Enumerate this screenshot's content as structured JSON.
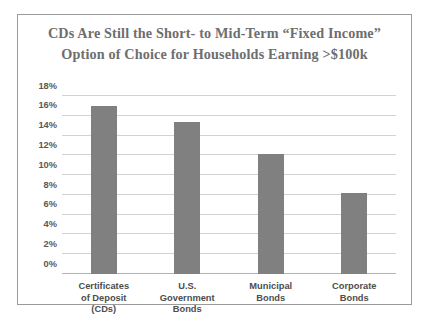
{
  "chart_data": {
    "type": "bar",
    "title": "CDs Are Still the Short- to Mid-Term “Fixed Income” Option of Choice for Households Earning >$100k",
    "title_lines": [
      "CDs Are Still the Short- to Mid-Term “Fixed Income”",
      "Option of Choice for Households Earning >$100k"
    ],
    "categories": [
      "Certificates of Deposit (CDs)",
      "U.S. Government Bonds",
      "Municipal Bonds",
      "Corporate Bonds"
    ],
    "category_lines": [
      [
        "Certificates",
        "of Deposit",
        "(CDs)"
      ],
      [
        "U.S.",
        "Government",
        "Bonds"
      ],
      [
        "Municipal",
        "Bonds"
      ],
      [
        "Corporate",
        "Bonds"
      ]
    ],
    "values": [
      17.0,
      15.4,
      12.1,
      8.2
    ],
    "xlabel": "",
    "ylabel": "",
    "ylim": [
      0,
      18
    ],
    "ytick_step": 2,
    "ytick_labels": [
      "18%",
      "16%",
      "14%",
      "12%",
      "10%",
      "8%",
      "6%",
      "4%",
      "2%",
      "0%"
    ],
    "ytick_values": [
      18,
      16,
      14,
      12,
      10,
      8,
      6,
      4,
      2,
      0
    ],
    "grid": true,
    "legend": false,
    "colors": {
      "bar": "#808080",
      "gridline": "#d2d2d2",
      "baseline": "#b4b4b4",
      "title_text": "#6e6e6e",
      "tick_text": "#595959",
      "category_text": "#4d4d4d",
      "frame_border": "#9a9a9a",
      "background": "#ffffff"
    }
  }
}
